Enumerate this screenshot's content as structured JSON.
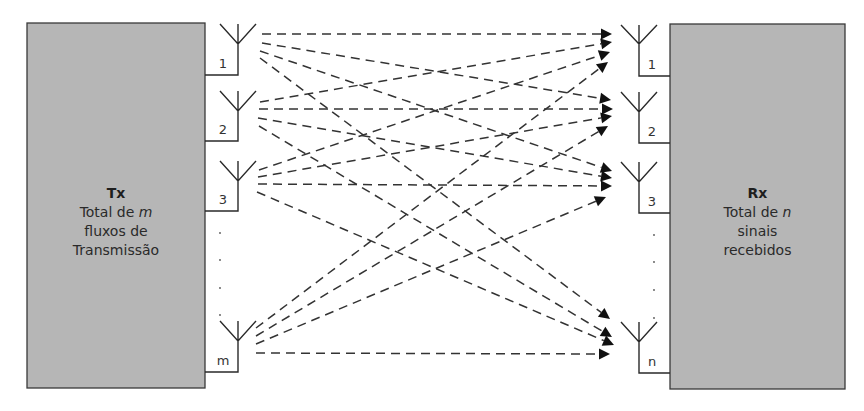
{
  "diagram": {
    "tx": {
      "title": "Tx",
      "line1_pre": "Total de ",
      "line1_var": "m",
      "line2": "fluxos de",
      "line3": "Transmissão",
      "box": {
        "x": 27,
        "y": 23,
        "w": 178,
        "h": 365
      },
      "antennas": [
        {
          "label": "1",
          "x": 238,
          "top": 24,
          "tip": 44,
          "bottom": 75
        },
        {
          "label": "2",
          "x": 238,
          "top": 91,
          "tip": 111,
          "bottom": 141
        },
        {
          "label": "3",
          "x": 238,
          "top": 161,
          "tip": 181,
          "bottom": 211
        },
        {
          "label": "m",
          "x": 238,
          "top": 321,
          "tip": 341,
          "bottom": 372
        }
      ],
      "ellipsis_dots": [
        {
          "x": 220,
          "y": 233
        },
        {
          "x": 220,
          "y": 260
        },
        {
          "x": 220,
          "y": 288
        },
        {
          "x": 220,
          "y": 315
        }
      ]
    },
    "rx": {
      "title": "Rx",
      "line1_pre": "Total de ",
      "line1_var": "n",
      "line2": "sinais",
      "line3": "recebidos",
      "box": {
        "x": 670,
        "y": 24,
        "w": 175,
        "h": 365
      },
      "antennas": [
        {
          "label": "1",
          "x": 639,
          "top": 25,
          "tip": 44,
          "bottom": 76
        },
        {
          "label": "2",
          "x": 639,
          "top": 92,
          "tip": 112,
          "bottom": 143
        },
        {
          "label": "3",
          "x": 639,
          "top": 162,
          "tip": 182,
          "bottom": 213
        },
        {
          "label": "n",
          "x": 639,
          "top": 322,
          "tip": 342,
          "bottom": 373
        }
      ],
      "ellipsis_dots": [
        {
          "x": 654,
          "y": 235
        },
        {
          "x": 654,
          "y": 262
        },
        {
          "x": 654,
          "y": 290
        },
        {
          "x": 654,
          "y": 318
        }
      ]
    },
    "links": [
      {
        "from": "1",
        "to": "1",
        "x1": 262,
        "y1": 34,
        "x2": 612,
        "y2": 34
      },
      {
        "from": "1",
        "to": "2",
        "x1": 262,
        "y1": 43,
        "x2": 611,
        "y2": 100
      },
      {
        "from": "1",
        "to": "3",
        "x1": 260,
        "y1": 51,
        "x2": 612,
        "y2": 171
      },
      {
        "from": "1",
        "to": "n",
        "x1": 260,
        "y1": 58,
        "x2": 610,
        "y2": 319
      },
      {
        "from": "2",
        "to": "1",
        "x1": 260,
        "y1": 102,
        "x2": 612,
        "y2": 42
      },
      {
        "from": "2",
        "to": "2",
        "x1": 259,
        "y1": 109,
        "x2": 613,
        "y2": 109
      },
      {
        "from": "2",
        "to": "3",
        "x1": 258,
        "y1": 118,
        "x2": 612,
        "y2": 178
      },
      {
        "from": "2",
        "to": "n",
        "x1": 259,
        "y1": 126,
        "x2": 612,
        "y2": 337
      },
      {
        "from": "3",
        "to": "1",
        "x1": 259,
        "y1": 170,
        "x2": 610,
        "y2": 52
      },
      {
        "from": "3",
        "to": "2",
        "x1": 258,
        "y1": 177,
        "x2": 612,
        "y2": 116
      },
      {
        "from": "3",
        "to": "3",
        "x1": 258,
        "y1": 184,
        "x2": 612,
        "y2": 186
      },
      {
        "from": "3",
        "to": "n",
        "x1": 257,
        "y1": 192,
        "x2": 614,
        "y2": 345
      },
      {
        "from": "m",
        "to": "1",
        "x1": 256,
        "y1": 328,
        "x2": 608,
        "y2": 62
      },
      {
        "from": "m",
        "to": "2",
        "x1": 256,
        "y1": 336,
        "x2": 608,
        "y2": 126
      },
      {
        "from": "m",
        "to": "3",
        "x1": 256,
        "y1": 344,
        "x2": 606,
        "y2": 197
      },
      {
        "from": "m",
        "to": "n",
        "x1": 256,
        "y1": 353,
        "x2": 610,
        "y2": 354
      }
    ]
  }
}
